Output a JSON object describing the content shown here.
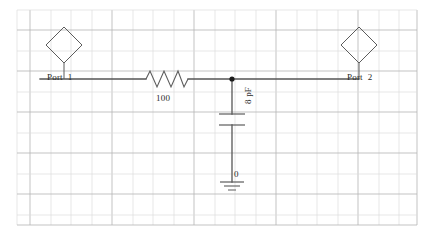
{
  "canvas": {
    "width": 434,
    "height": 240,
    "background": "#ffffff"
  },
  "grid": {
    "left": 17,
    "top": 10,
    "right": 417,
    "bottom": 225,
    "spacing": 20.5,
    "minor_color": "#d8d8d8",
    "major_color": "#a8a8a8",
    "visible": true
  },
  "colors": {
    "wire": "#555555",
    "symbol": "#555555",
    "text": "#2b2b2b",
    "junction": "#1a1a1a"
  },
  "schematic": {
    "title": "RC low-pass two-port network",
    "nodes": {
      "wire_y": 79,
      "junction_x": 232,
      "junction_y": 79
    },
    "components": [
      {
        "id": "port1",
        "type": "port",
        "symbol": "diamond",
        "label": "Port  1",
        "x": 64,
        "y": 45,
        "size": 22
      },
      {
        "id": "resistor1",
        "type": "resistor",
        "symbol": "zigzag",
        "label": "100",
        "value": "100",
        "unit": "ohm",
        "x1": 146,
        "x2": 188,
        "y": 79
      },
      {
        "id": "capacitor1",
        "type": "capacitor",
        "symbol": "parallel-plates",
        "label": "8 pF",
        "value": "8",
        "unit": "pF",
        "x": 232,
        "plate_top_y": 114,
        "plate_bottom_y": 125,
        "plate_width": 26
      },
      {
        "id": "ground1",
        "type": "ground",
        "symbol": "ground-bars",
        "label": "0",
        "x": 232,
        "y": 182
      },
      {
        "id": "port2",
        "type": "port",
        "symbol": "diamond",
        "label": "Port  2",
        "x": 359,
        "y": 45,
        "size": 22
      }
    ],
    "wires": [
      {
        "id": "wire-port1-to-resistor",
        "x1": 40,
        "y1": 79,
        "x2": 146,
        "y2": 79
      },
      {
        "id": "wire-resistor-to-junction",
        "x1": 188,
        "y1": 79,
        "x2": 232,
        "y2": 79
      },
      {
        "id": "wire-junction-to-port2",
        "x1": 232,
        "y1": 79,
        "x2": 359,
        "y2": 79
      },
      {
        "id": "wire-junction-to-capacitor",
        "x1": 232,
        "y1": 79,
        "x2": 232,
        "y2": 114
      },
      {
        "id": "wire-capacitor-to-ground",
        "x1": 232,
        "y1": 125,
        "x2": 232,
        "y2": 182
      }
    ]
  },
  "labels": {
    "port1": "Port  1",
    "port2": "Port  2",
    "resistor_value": "100",
    "capacitor_value": "8 pF",
    "ground_value": "0"
  }
}
